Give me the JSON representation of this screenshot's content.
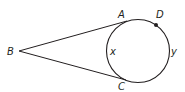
{
  "diagram": {
    "colors": {
      "stroke": "#231f20",
      "background": "#ffffff"
    },
    "circle": {
      "cx": 138,
      "cy": 51,
      "r": 31.5
    },
    "points": {
      "B": {
        "label": "B",
        "x": 19,
        "y": 51
      },
      "A": {
        "label": "A",
        "x": 127,
        "y": 21
      },
      "C": {
        "label": "C",
        "x": 126,
        "y": 80
      },
      "D": {
        "label": "D",
        "x": 156,
        "y": 25
      }
    },
    "arc_labels": {
      "x": {
        "label": "x",
        "note": "minor arc AC"
      },
      "y": {
        "label": "y",
        "note": "major arc ADC"
      }
    }
  }
}
